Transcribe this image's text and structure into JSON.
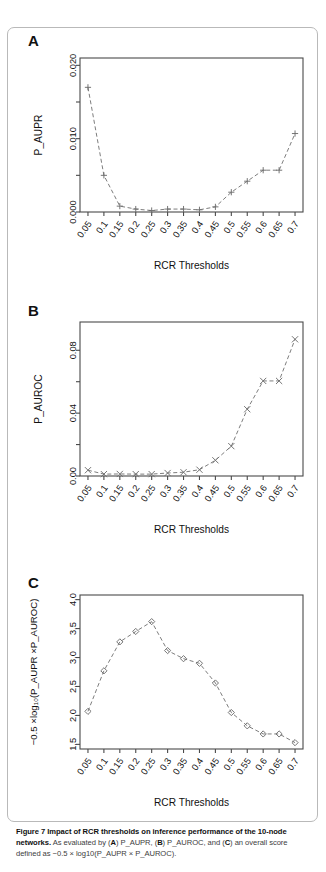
{
  "figure": {
    "caption_bold": "Figure 7 Impact of RCR thresholds on inference performance of the 10-node networks.",
    "caption_rest_1": " As evaluated by (",
    "caption_a": "A",
    "caption_rest_2": ") P_AUPR, (",
    "caption_b": "B",
    "caption_rest_3": ") P_AUROC, and (",
    "caption_c": "C",
    "caption_rest_4": ") an overall score defined as −0.5 × log10(P_AUPR × P_AUROC)."
  },
  "panels": {
    "a": {
      "letter": "A"
    },
    "b": {
      "letter": "B"
    },
    "c": {
      "letter": "C"
    }
  },
  "chart_data": [
    {
      "type": "line",
      "panel": "A",
      "title": "",
      "xlabel": "RCR Thresholds",
      "ylabel": "P_AUPR",
      "marker": "plus",
      "linestyle": "dashed",
      "grid": false,
      "categories": [
        "0.05",
        "0.1",
        "0.15",
        "0.2",
        "0.25",
        "0.3",
        "0.35",
        "0.4",
        "0.45",
        "0.5",
        "0.55",
        "0.6",
        "0.65",
        "0.7"
      ],
      "x": [
        0.05,
        0.1,
        0.15,
        0.2,
        0.25,
        0.3,
        0.35,
        0.4,
        0.45,
        0.5,
        0.55,
        0.6,
        0.65,
        0.7
      ],
      "values": [
        0.017,
        0.005,
        0.0008,
        0.0004,
        0.0002,
        0.0004,
        0.0004,
        0.0003,
        0.0007,
        0.0027,
        0.0042,
        0.0057,
        0.0057,
        0.0107
      ],
      "ylim": [
        0.0,
        0.021
      ],
      "yticks": [
        0.0,
        0.01,
        0.02
      ],
      "ytick_labels": [
        "0.000",
        "0.010",
        "0.020"
      ],
      "yminor": [
        0.005,
        0.015
      ]
    },
    {
      "type": "line",
      "panel": "B",
      "title": "",
      "xlabel": "RCR Thresholds",
      "ylabel": "P_AUROC",
      "marker": "cross",
      "linestyle": "dashed",
      "grid": false,
      "categories": [
        "0.05",
        "0.1",
        "0.15",
        "0.2",
        "0.25",
        "0.3",
        "0.35",
        "0.4",
        "0.45",
        "0.5",
        "0.55",
        "0.6",
        "0.65",
        "0.7"
      ],
      "x": [
        0.05,
        0.1,
        0.15,
        0.2,
        0.25,
        0.3,
        0.35,
        0.4,
        0.45,
        0.5,
        0.55,
        0.6,
        0.65,
        0.7
      ],
      "values": [
        0.0037,
        0.0012,
        0.0013,
        0.0012,
        0.0012,
        0.0019,
        0.0024,
        0.004,
        0.01,
        0.019,
        0.0425,
        0.0605,
        0.0605,
        0.087
      ],
      "ylim": [
        0.0,
        0.098
      ],
      "yticks": [
        0.0,
        0.04,
        0.08
      ],
      "ytick_labels": [
        "0.00",
        "0.04",
        "0.08"
      ],
      "yminor": [
        0.02,
        0.06
      ]
    },
    {
      "type": "line",
      "panel": "C",
      "title": "",
      "xlabel": "RCR Thresholds",
      "ylabel": "−0.5 ×log₁₀(P_AUPR ×P_AUROC)",
      "marker": "diamond",
      "linestyle": "dashed",
      "grid": false,
      "categories": [
        "0.05",
        "0.1",
        "0.15",
        "0.2",
        "0.25",
        "0.3",
        "0.35",
        "0.4",
        "0.45",
        "0.5",
        "0.55",
        "0.6",
        "0.65",
        "0.7"
      ],
      "x": [
        0.05,
        0.1,
        0.15,
        0.2,
        0.25,
        0.3,
        0.35,
        0.4,
        0.45,
        0.5,
        0.55,
        0.6,
        0.65,
        0.7
      ],
      "values": [
        2.07,
        2.77,
        3.27,
        3.45,
        3.62,
        3.12,
        2.98,
        2.9,
        2.56,
        2.05,
        1.82,
        1.68,
        1.68,
        1.53
      ],
      "ylim": [
        1.42,
        4.08
      ],
      "yticks": [
        1.5,
        2.0,
        2.5,
        3.0,
        3.5,
        4.0
      ],
      "ytick_labels": [
        "1.5",
        "2.0",
        "2.5",
        "3.0",
        "3.5",
        "4.0"
      ],
      "yminor": []
    }
  ],
  "axis_titles": {
    "x_axis_label": "RCR Thresholds"
  },
  "colors": {
    "line": "#6e6e6e",
    "frame": "#4a4a4a",
    "text": "#111111",
    "border": "#b9b9b9"
  }
}
